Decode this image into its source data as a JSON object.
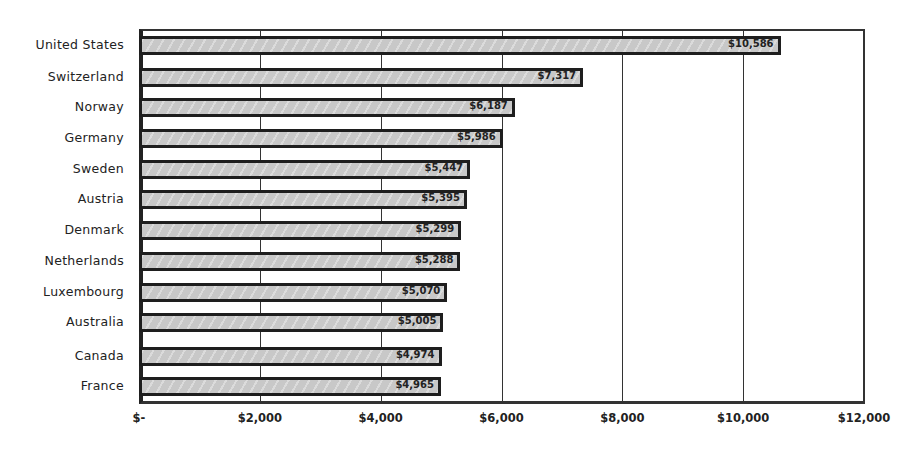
{
  "chart_data": {
    "type": "bar",
    "orientation": "horizontal",
    "title": "",
    "xlabel": "",
    "ylabel": "",
    "categories": [
      "United States",
      "Switzerland",
      "Norway",
      "Germany",
      "Sweden",
      "Austria",
      "Denmark",
      "Netherlands",
      "Luxembourg",
      "Australia",
      "Canada",
      "France"
    ],
    "values": [
      10586,
      7317,
      6187,
      5986,
      5447,
      5395,
      5299,
      5288,
      5070,
      5005,
      4974,
      4965
    ],
    "data_labels": [
      "$10,586",
      "$7,317",
      "$6,187",
      "$5,986",
      "$5,447",
      "$5,395",
      "$5,299",
      "$5,288",
      "$5,070",
      "$5,005",
      "$4,974",
      "$4,965"
    ],
    "xlim": [
      0,
      12000
    ],
    "x_ticks": [
      0,
      2000,
      4000,
      6000,
      8000,
      10000,
      12000
    ],
    "x_tick_labels": [
      "$-",
      "$2,000",
      "$4,000",
      "$6,000",
      "$8,000",
      "$10,000",
      "$12,000"
    ],
    "grid": {
      "vertical": true,
      "horizontal": false
    },
    "legend": null,
    "bar_color": "#c8c8c8",
    "bar_edge_color": "#1e1e1e"
  }
}
